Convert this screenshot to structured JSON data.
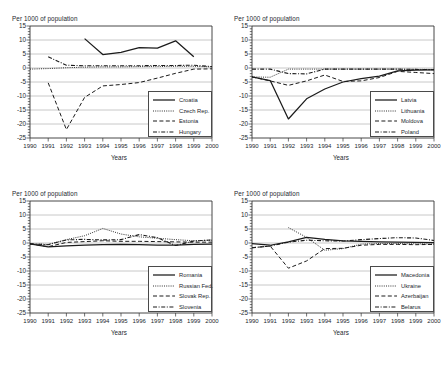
{
  "figure": {
    "ylabel": "Per 1000 of population",
    "xlabel": "Years",
    "yticks": [
      "15",
      "10",
      "5",
      "0",
      "-5",
      "-10",
      "-15",
      "-20",
      "-25"
    ],
    "xticks": [
      "1990",
      "1991",
      "1992",
      "1993",
      "1994",
      "1995",
      "1996",
      "1997",
      "1998",
      "1999",
      "2000"
    ]
  },
  "chart_data": [
    {
      "type": "line",
      "panel": "top-left",
      "title": "Per 1000 of population",
      "xlabel": "Years",
      "ylabel": "Per 1000 of population",
      "x": [
        1990,
        1991,
        1992,
        1993,
        1994,
        1995,
        1996,
        1997,
        1998,
        1999,
        2000
      ],
      "ylim": [
        -25,
        15
      ],
      "xlim": [
        1990,
        2000
      ],
      "grid": true,
      "legend_position": "lower-right",
      "series": [
        {
          "name": "Croatia",
          "style": "solid",
          "values": [
            null,
            null,
            null,
            10.5,
            4.8,
            5.6,
            7.3,
            7.1,
            9.7,
            4.0,
            null
          ]
        },
        {
          "name": "Czech Rep.",
          "style": "dotted",
          "values": [
            -0.4,
            -0.2,
            0.1,
            0.3,
            0.4,
            0.4,
            0.5,
            0.5,
            0.6,
            0.6,
            0.4
          ]
        },
        {
          "name": "Estonia",
          "style": "dashed",
          "values": [
            null,
            -5.3,
            -22.0,
            -10.5,
            -6.4,
            -5.9,
            -5.2,
            -3.6,
            -1.9,
            -0.4,
            -0.3
          ]
        },
        {
          "name": "Hungary",
          "style": "dashdot",
          "values": [
            null,
            4.0,
            1.0,
            0.8,
            0.8,
            0.8,
            0.8,
            0.9,
            0.9,
            1.0,
            0.5
          ]
        }
      ]
    },
    {
      "type": "line",
      "panel": "top-right",
      "title": "Per 1000 of population",
      "xlabel": "Years",
      "ylabel": "Per 1000 of population",
      "x": [
        1990,
        1991,
        1992,
        1993,
        1994,
        1995,
        1996,
        1997,
        1998,
        1999,
        2000
      ],
      "ylim": [
        -25,
        15
      ],
      "xlim": [
        1990,
        2000
      ],
      "grid": true,
      "legend_position": "lower-right",
      "series": [
        {
          "name": "Latvia",
          "style": "solid",
          "values": [
            -3.2,
            -4.5,
            -18.2,
            -11.0,
            -7.5,
            -5.0,
            -3.8,
            -2.9,
            -1.0,
            -0.8,
            -0.7
          ]
        },
        {
          "name": "Lithuania",
          "style": "dotted",
          "values": [
            -3.2,
            -3.3,
            -0.4,
            -0.4,
            -0.4,
            -0.4,
            -0.4,
            -0.4,
            -0.4,
            -0.5,
            -0.5
          ]
        },
        {
          "name": "Moldova",
          "style": "dashed",
          "values": [
            -3.2,
            -4.6,
            -6.2,
            -4.6,
            -2.5,
            -4.8,
            -4.6,
            -3.4,
            -1.2,
            -1.6,
            -2.0
          ]
        },
        {
          "name": "Poland",
          "style": "dashdot",
          "values": [
            -0.4,
            -0.4,
            -2.0,
            -2.1,
            -0.4,
            -0.4,
            -0.4,
            -0.4,
            -0.4,
            -0.5,
            -0.6
          ]
        }
      ]
    },
    {
      "type": "line",
      "panel": "bottom-left",
      "title": "Per 1000 of population",
      "xlabel": "Years",
      "ylabel": "Per 1000 of population",
      "x": [
        1990,
        1991,
        1992,
        1993,
        1994,
        1995,
        1996,
        1997,
        1998,
        1999,
        2000
      ],
      "ylim": [
        -25,
        15
      ],
      "xlim": [
        1990,
        2000
      ],
      "grid": true,
      "legend_position": "lower-right",
      "series": [
        {
          "name": "Romania",
          "style": "solid",
          "values": [
            -0.3,
            -1.4,
            -1.0,
            -0.8,
            -0.6,
            -0.5,
            -0.6,
            -0.8,
            -0.8,
            -0.5,
            -0.4
          ]
        },
        {
          "name": "Russian Fed.",
          "style": "dotted",
          "values": [
            -0.3,
            -0.5,
            1.2,
            2.6,
            5.2,
            3.2,
            2.2,
            1.7,
            1.2,
            0.8,
            1.0
          ]
        },
        {
          "name": "Slovak Rep.",
          "style": "dashed",
          "values": [
            -0.3,
            -1.3,
            0.2,
            0.5,
            0.8,
            0.6,
            0.6,
            0.5,
            0.4,
            0.3,
            0.3
          ]
        },
        {
          "name": "Slovenia",
          "style": "dashdot",
          "values": [
            -0.3,
            -0.6,
            1.1,
            1.3,
            1.1,
            1.2,
            3.0,
            1.9,
            -0.9,
            0.7,
            1.1
          ]
        }
      ]
    },
    {
      "type": "line",
      "panel": "bottom-right",
      "title": "Per 1000 of population",
      "xlabel": "Years",
      "ylabel": "Per 1000 of population",
      "x": [
        1990,
        1991,
        1992,
        1993,
        1994,
        1995,
        1996,
        1997,
        1998,
        1999,
        2000
      ],
      "ylim": [
        -25,
        15
      ],
      "xlim": [
        1990,
        2000
      ],
      "grid": true,
      "legend_position": "lower-right",
      "series": [
        {
          "name": "Macedonia",
          "style": "solid",
          "values": [
            -0.2,
            -0.8,
            0.4,
            2.0,
            1.3,
            0.8,
            0.6,
            0.4,
            0.3,
            0.2,
            0.1
          ]
        },
        {
          "name": "Ukraine",
          "style": "dotted",
          "values": [
            null,
            null,
            5.5,
            2.0,
            -2.6,
            -2.0,
            -0.4,
            -0.2,
            -0.2,
            -0.3,
            -0.4
          ]
        },
        {
          "name": "Azerbaijan",
          "style": "dashed",
          "values": [
            -1.7,
            -1.1,
            -9.0,
            -6.4,
            -2.0,
            -1.9,
            -0.8,
            -0.5,
            -0.5,
            -0.6,
            -0.5
          ]
        },
        {
          "name": "Belarus",
          "style": "dashdot",
          "values": [
            -1.7,
            -1.1,
            0.3,
            1.0,
            0.8,
            0.7,
            1.2,
            1.6,
            1.9,
            1.8,
            0.9
          ]
        }
      ]
    }
  ],
  "legends": [
    {
      "items": [
        {
          "label": "Croatia"
        },
        {
          "label": "Czech Rep."
        },
        {
          "label": "Estonia"
        },
        {
          "label": "Hungary"
        }
      ]
    },
    {
      "items": [
        {
          "label": "Latvia"
        },
        {
          "label": "Lithuania"
        },
        {
          "label": "Moldova"
        },
        {
          "label": "Poland"
        }
      ]
    },
    {
      "items": [
        {
          "label": "Romania"
        },
        {
          "label": "Russian Fed."
        },
        {
          "label": "Slovak Rep."
        },
        {
          "label": "Slovenia"
        }
      ]
    },
    {
      "items": [
        {
          "label": "Macedonia"
        },
        {
          "label": "Ukraine"
        },
        {
          "label": "Azerbaijan"
        },
        {
          "label": "Belarus"
        }
      ]
    }
  ],
  "colors": {
    "ink": "#23282d",
    "grid": "#9a9a9a",
    "frame": "#333333"
  }
}
